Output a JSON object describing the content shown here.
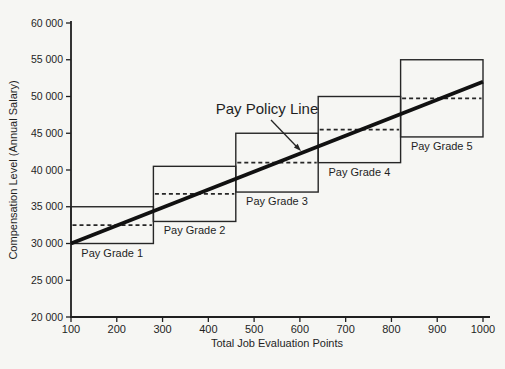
{
  "colors": {
    "background": "#f6f6f3",
    "axis": "#1f1f1f",
    "box_stroke": "#262626",
    "policy_line": "#111111",
    "text": "#1f1f1f"
  },
  "chart_data": {
    "type": "line",
    "title": "",
    "xlabel": "Total Job Evaluation Points",
    "ylabel": "Compensation Level (Annual Salary)",
    "xlim": [
      100,
      1000
    ],
    "ylim": [
      20000,
      60000
    ],
    "grid": false,
    "x_ticks": [
      100,
      200,
      300,
      400,
      500,
      600,
      700,
      800,
      900,
      1000
    ],
    "x_tick_labels": [
      "100",
      "200",
      "300",
      "400",
      "500",
      "600",
      "700",
      "800",
      "900",
      "1000"
    ],
    "y_ticks": [
      20000,
      25000,
      30000,
      35000,
      40000,
      45000,
      50000,
      55000,
      60000
    ],
    "y_tick_labels": [
      "20 000",
      "25 000",
      "30 000",
      "35 000",
      "40 000",
      "45 000",
      "50 000",
      "55 000",
      "60 000"
    ],
    "policy_line": {
      "label": "Pay Policy Line",
      "x": [
        100,
        1000
      ],
      "y": [
        30000,
        52000
      ]
    },
    "pay_grades": [
      {
        "label": "Pay Grade 1",
        "points_min": 100,
        "points_max": 280,
        "salary_min": 30000,
        "salary_max": 35000,
        "midpoint": 32500
      },
      {
        "label": "Pay Grade 2",
        "points_min": 280,
        "points_max": 460,
        "salary_min": 33000,
        "salary_max": 40500,
        "midpoint": 36750
      },
      {
        "label": "Pay Grade 3",
        "points_min": 460,
        "points_max": 640,
        "salary_min": 37000,
        "salary_max": 45000,
        "midpoint": 41000
      },
      {
        "label": "Pay Grade 4",
        "points_min": 640,
        "points_max": 820,
        "salary_min": 41000,
        "salary_max": 50000,
        "midpoint": 45500
      },
      {
        "label": "Pay Grade 5",
        "points_min": 820,
        "points_max": 1000,
        "salary_min": 44500,
        "salary_max": 55000,
        "midpoint": 49750
      }
    ]
  }
}
